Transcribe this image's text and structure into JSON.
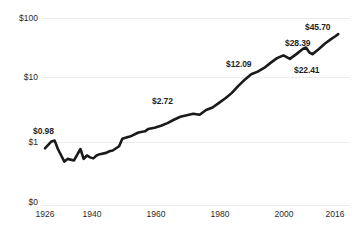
{
  "chart_data": {
    "type": "line",
    "title": "",
    "subtitle": "",
    "xlabel": "",
    "ylabel": "",
    "yscale": "log",
    "ylim": [
      0,
      100
    ],
    "xlim": [
      1926,
      2018
    ],
    "grid": true,
    "legend_position": "none",
    "y_ticks": [
      {
        "label": "$100",
        "value": 100
      },
      {
        "label": "$10",
        "value": 10
      },
      {
        "label": "$1",
        "value": 1
      },
      {
        "label": "$0",
        "value": 0
      }
    ],
    "x_ticks": [
      {
        "label": "1926",
        "value": 1926
      },
      {
        "label": "1940",
        "value": 1940
      },
      {
        "label": "1960",
        "value": 1960
      },
      {
        "label": "1980",
        "value": 1980
      },
      {
        "label": "2000",
        "value": 2000
      },
      {
        "label": "2016",
        "value": 2016
      }
    ],
    "series": [
      {
        "name": "Growth of $1",
        "color": "#1a1a1a",
        "x": [
          1926,
          1928,
          1929,
          1930,
          1932,
          1933,
          1935,
          1937,
          1938,
          1939,
          1940,
          1941,
          1942,
          1943,
          1945,
          1946,
          1947,
          1949,
          1950,
          1952,
          1953,
          1955,
          1957,
          1958,
          1960,
          1962,
          1964,
          1966,
          1968,
          1970,
          1972,
          1974,
          1976,
          1978,
          1980,
          1982,
          1984,
          1986,
          1988,
          1990,
          1992,
          1994,
          1996,
          1998,
          2000,
          2002,
          2004,
          2006,
          2007,
          2008,
          2009,
          2011,
          2013,
          2015,
          2016,
          2017
        ],
        "y": [
          0.8,
          1.02,
          1.05,
          0.78,
          0.5,
          0.55,
          0.52,
          0.78,
          0.55,
          0.62,
          0.58,
          0.56,
          0.62,
          0.65,
          0.68,
          0.72,
          0.74,
          0.86,
          1.12,
          1.2,
          1.25,
          1.4,
          1.46,
          1.58,
          1.66,
          1.78,
          1.95,
          2.2,
          2.45,
          2.58,
          2.72,
          2.62,
          3.1,
          3.4,
          4.0,
          4.7,
          5.7,
          7.3,
          9.1,
          11.0,
          12.09,
          13.8,
          16.5,
          19.5,
          21.5,
          19.0,
          22.5,
          27.0,
          28.39,
          24.0,
          22.41,
          27.0,
          33.0,
          39.0,
          42.0,
          45.7
        ]
      }
    ],
    "annotations": [
      {
        "label": "$0.98",
        "x": 1929,
        "y": 0.98
      },
      {
        "label": "$2.72",
        "x": 1972,
        "y": 2.72
      },
      {
        "label": "$12.09",
        "x": 1992,
        "y": 12.09
      },
      {
        "label": "$28.39",
        "x": 2007,
        "y": 28.39
      },
      {
        "label": "$22.41",
        "x": 2009,
        "y": 22.41
      },
      {
        "label": "$45.70",
        "x": 2017,
        "y": 45.7
      }
    ],
    "colors": {
      "line": "#1a1a1a",
      "gridline": "#ececec",
      "text": "#2b2b2b",
      "background": "#ffffff"
    }
  }
}
